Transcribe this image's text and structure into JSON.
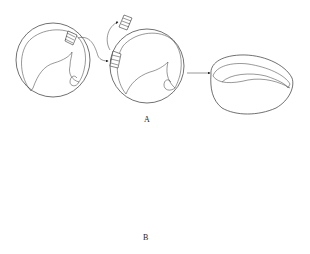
{
  "figure": {
    "panels": [
      {
        "id": "A",
        "label": "A",
        "stages": [
          "ring-with-graft-site",
          "ring-graft-removed",
          "grain-section"
        ]
      },
      {
        "id": "B",
        "label": "B",
        "stages": [
          "ring-with-graft-site",
          "ring-graft-removed",
          "grain-section"
        ]
      }
    ],
    "colors": {
      "stroke": "#333333",
      "background": "#ffffff"
    }
  }
}
